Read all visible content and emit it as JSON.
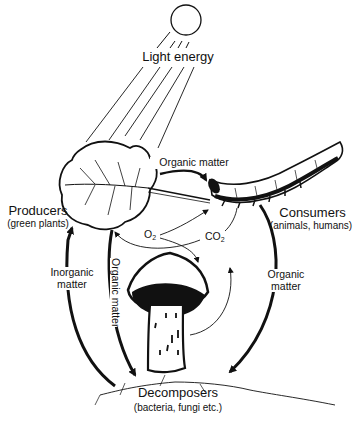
{
  "diagram": {
    "colors": {
      "ink": "#111111",
      "background": "#ffffff"
    },
    "nodes": {
      "sun": {
        "label": "Light energy",
        "icon": "sun-icon"
      },
      "producers": {
        "title": "Producers",
        "subtitle": "(green plants)",
        "icon": "leaf-icon"
      },
      "consumers": {
        "title": "Consumers",
        "subtitle": "(animals, humans)",
        "icon": "caterpillar-icon"
      },
      "decomposers": {
        "title": "Decomposers",
        "subtitle": "(bacteria, fungi etc.)",
        "icon": "mushroom-icon"
      }
    },
    "edges": [
      {
        "from": "sun",
        "to": "producers",
        "label": ""
      },
      {
        "from": "producers",
        "to": "consumers",
        "label": "Organic matter"
      },
      {
        "from": "producers",
        "to": "consumers",
        "label": "O",
        "sub": "2"
      },
      {
        "from": "consumers",
        "to": "producers",
        "label": "CO",
        "sub": "2"
      },
      {
        "from": "decomposers",
        "to": "producers",
        "label_line1": "Inorganic",
        "label_line2": "matter"
      },
      {
        "from": "producers",
        "to": "decomposers",
        "label": "Organic matter"
      },
      {
        "from": "consumers",
        "to": "decomposers",
        "label_line1": "Organic",
        "label_line2": "matter"
      }
    ]
  }
}
